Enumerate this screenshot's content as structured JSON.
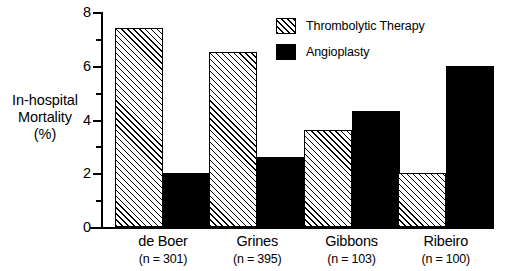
{
  "chart_data": {
    "type": "bar",
    "title": "",
    "xlabel": "",
    "ylabel": "In-hospital Mortality (%)",
    "ylabel_lines": [
      "In-hospital",
      "Mortality",
      "(%)"
    ],
    "ylim": [
      0,
      8
    ],
    "ytick_values": [
      0,
      2,
      4,
      6,
      8
    ],
    "ytick_labels": [
      "0",
      "2",
      "4",
      "6",
      "8"
    ],
    "yminor_values": [
      1,
      3,
      5,
      7
    ],
    "grid": false,
    "legend_position": "top-right",
    "categories": [
      "de Boer",
      "Grines",
      "Gibbons",
      "Ribeiro"
    ],
    "category_sublabels": [
      "(n = 301)",
      "(n = 395)",
      "(n = 103)",
      "(n = 100)"
    ],
    "series": [
      {
        "name": "Thrombolytic Therapy",
        "fill": "hatch",
        "color": "#ffffff",
        "values": [
          7.4,
          6.5,
          3.6,
          2.0
        ]
      },
      {
        "name": "Angioplasty",
        "fill": "solid",
        "color": "#000000",
        "values": [
          2.0,
          2.6,
          4.3,
          6.0
        ]
      }
    ]
  },
  "legend": {
    "items": [
      {
        "label": "Thrombolytic Therapy",
        "fill": "hatch"
      },
      {
        "label": "Angioplasty",
        "fill": "solid"
      }
    ]
  }
}
